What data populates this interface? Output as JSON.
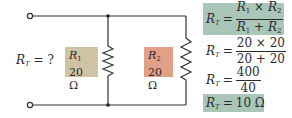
{
  "colors": {
    "wire": "#333333",
    "r1_fill": "#cfc3a3",
    "r2_fill": "#e2a087",
    "formula_highlight": "#a9c6b8"
  },
  "unknown_label": {
    "var": "R",
    "sub": "T",
    "rest": " = ?"
  },
  "resistors": [
    {
      "name": "R",
      "sub": "1",
      "value": "20 Ω"
    },
    {
      "name": "R",
      "sub": "2",
      "value": "20 Ω"
    }
  ],
  "equations": [
    {
      "lhs": "R",
      "lhs_sub": "T",
      "eq": "=",
      "num_a": "R",
      "num_a_sub": "1",
      "num_op": " × ",
      "num_b": "R",
      "num_b_sub": "2",
      "den_a": "R",
      "den_a_sub": "1",
      "den_op": " + ",
      "den_b": "R",
      "den_b_sub": "2",
      "highlighted": true
    },
    {
      "lhs": "R",
      "lhs_sub": "T",
      "eq": "=",
      "num": "20 × 20",
      "den": "20 + 20",
      "highlighted": false
    },
    {
      "lhs": "R",
      "lhs_sub": "T",
      "eq": "=",
      "num": "400",
      "den": "40",
      "highlighted": false
    },
    {
      "lhs": "R",
      "lhs_sub": "T",
      "eq": "=",
      "rhs": "10 Ω",
      "highlighted": true
    }
  ]
}
